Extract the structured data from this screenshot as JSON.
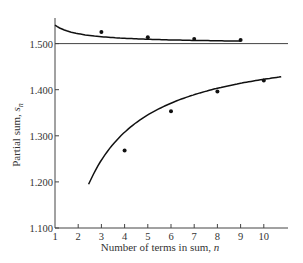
{
  "chart_data": {
    "type": "line",
    "title": "",
    "xlabel": "Number of terms in sum, n",
    "ylabel": "Partial sum, s_n",
    "xlim": [
      1,
      10.8
    ],
    "ylim": [
      1.1,
      1.55
    ],
    "x_ticks": [
      "1",
      "2",
      "3",
      "4",
      "5",
      "6",
      "7",
      "8",
      "9",
      "10"
    ],
    "y_ticks": [
      "1.100",
      "1.200",
      "1.300",
      "1.400",
      "1.500"
    ],
    "grid": false,
    "reference_line": {
      "y": 1.5,
      "label": "1.500"
    },
    "series": [
      {
        "name": "odd partial sums (upper)",
        "x": [
          3,
          5,
          7,
          9
        ],
        "values": [
          1.525,
          1.514,
          1.51,
          1.508
        ]
      },
      {
        "name": "even partial sums (lower)",
        "x": [
          4,
          6,
          8,
          10
        ],
        "values": [
          1.268,
          1.353,
          1.396,
          1.42
        ]
      }
    ],
    "legend": null
  },
  "axes": {
    "xlabel_main": "Number of terms in sum, ",
    "xlabel_var": "n",
    "ylabel_main": "Partial sum, ",
    "ylabel_var": "s",
    "ylabel_sub": "n"
  }
}
